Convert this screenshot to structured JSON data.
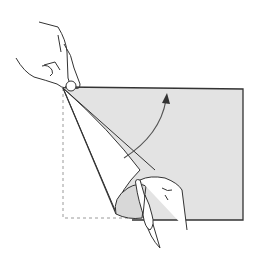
{
  "illustration": {
    "subject": "paper-folding-step",
    "description": "Two hands lifting and folding the bottom-left corner of a square sheet of paper up toward the top-left corner; curved arrow shows fold direction; dashed outline marks original sheet position",
    "colors": {
      "paper_fill": "#e3e3e3",
      "paper_back": "#ffffff",
      "outline": "#333333",
      "dashed_outline": "#999999",
      "arrow": "#555555"
    }
  }
}
